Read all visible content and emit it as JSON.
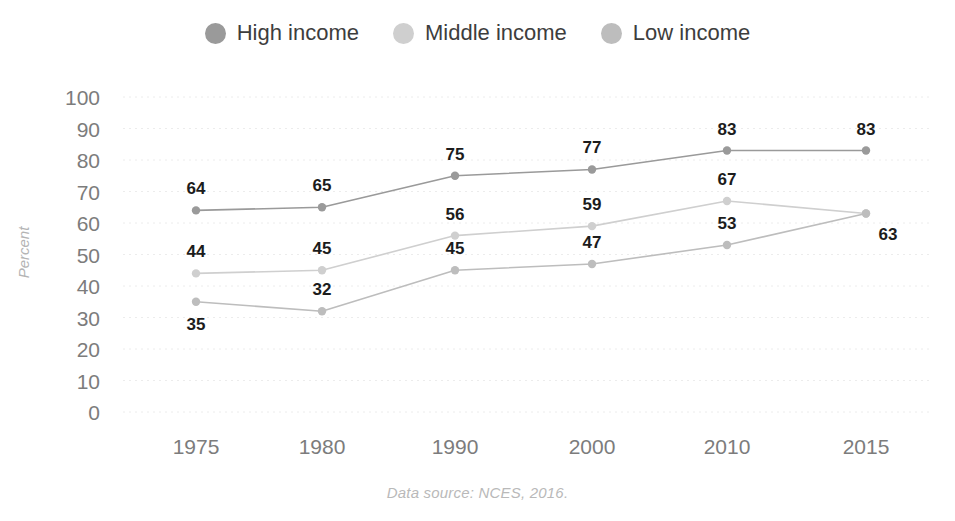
{
  "legend": {
    "items": [
      {
        "label": "High income",
        "color": "#9a9a9a",
        "marker": "circle-marker-high"
      },
      {
        "label": "Middle income",
        "color": "#cfcfcf",
        "marker": "circle-marker-middle"
      },
      {
        "label": "Low income",
        "color": "#bdbdbd",
        "marker": "circle-marker-low"
      }
    ]
  },
  "source": {
    "text": "Data source: NCES, 2016."
  },
  "chart_data": {
    "type": "line",
    "title": "",
    "xlabel": "",
    "ylabel": "Percent",
    "categories": [
      "1975",
      "1980",
      "1990",
      "2000",
      "2010",
      "2015"
    ],
    "ylim": [
      0,
      100
    ],
    "yticks": [
      "0",
      "10",
      "20",
      "30",
      "40",
      "50",
      "60",
      "70",
      "80",
      "90",
      "100"
    ],
    "grid": true,
    "legend_position": "top-center",
    "series": [
      {
        "name": "High income",
        "color": "#9a9a9a",
        "values": [
          64,
          65,
          75,
          77,
          83,
          83
        ],
        "labels": [
          "64",
          "65",
          "75",
          "77",
          "83",
          "83"
        ],
        "label_positions": [
          "above",
          "above",
          "above",
          "above",
          "above",
          "above"
        ]
      },
      {
        "name": "Middle income",
        "color": "#cfcfcf",
        "values": [
          44,
          45,
          56,
          59,
          67,
          63
        ],
        "labels": [
          "44",
          "45",
          "56",
          "59",
          "67",
          ""
        ],
        "label_positions": [
          "above",
          "above",
          "above",
          "above",
          "above",
          "none"
        ]
      },
      {
        "name": "Low income",
        "color": "#bdbdbd",
        "values": [
          35,
          32,
          45,
          47,
          53,
          63
        ],
        "labels": [
          "35",
          "32",
          "45",
          "47",
          "53",
          "63"
        ],
        "label_positions": [
          "below",
          "above",
          "above",
          "above",
          "above",
          "below-right"
        ]
      }
    ]
  }
}
